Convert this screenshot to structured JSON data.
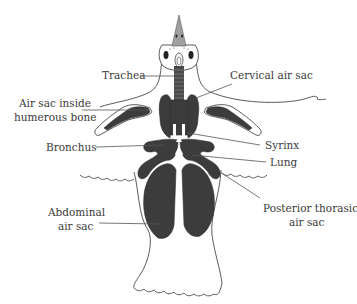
{
  "diagram": {
    "colors": {
      "organ_fill": "#3c3c3c",
      "beak_fill": "#a0a0a0",
      "outline": "#4a4a4a",
      "label_text": "#3a3a3a",
      "background": "#ffffff"
    },
    "labels": {
      "trachea": "Trachea",
      "cervical_air_sac": "Cervical air sac",
      "air_sac_humerus_line1": "Air sac inside",
      "air_sac_humerus_line2": "humerous bone",
      "syrinx": "Syrinx",
      "bronchus": "Bronchus",
      "lung": "Lung",
      "abdominal_line1": "Abdominal",
      "abdominal_line2": "air sac",
      "posterior_thoracic_line1": "Posterior thorasic",
      "posterior_thoracic_line2": "air sac"
    }
  }
}
